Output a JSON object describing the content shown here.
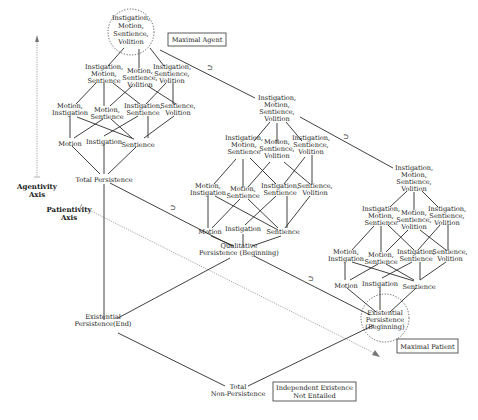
{
  "axes": {
    "agentivity": {
      "label_line1": "Agentivity",
      "label_line2": "Axis"
    },
    "patientivity": {
      "label_line1": "Patientivity",
      "label_line2": "Axis"
    }
  },
  "boxes": {
    "maximal_agent": "Maximal Agent",
    "maximal_patient": "Maximal Patient",
    "independent_existence_line1": "Independent Existence",
    "independent_existence_line2": "Not Entailed"
  },
  "relation_symbol": "⊃",
  "lattices": [
    {
      "name": "agentive-lattice-total-persistence",
      "top": [
        "Instigation,",
        "Motion,",
        "Sentience,",
        "Volition"
      ],
      "row2": [
        [
          "Instigation,",
          "Motion,",
          "Sentience"
        ],
        [
          "Motion,",
          "Sentience,",
          "Volition"
        ],
        [
          "Instigation,",
          "Sentience,",
          "Volition"
        ]
      ],
      "row3": [
        [
          "Motion,",
          "Instigation"
        ],
        [
          "Motion,",
          "Sentience"
        ],
        [
          "Instigation,",
          "Sentience"
        ],
        [
          "Sentience,",
          "Volition"
        ]
      ],
      "row4": [
        "Motion",
        "Instigation",
        "Sentience"
      ],
      "bottom": [
        "Total Persistence"
      ]
    },
    {
      "name": "agentive-lattice-qualitative-persistence",
      "top": [
        "Instigation,",
        "Motion,",
        "Sentience,",
        "Volition"
      ],
      "row2": [
        [
          "Instigation,",
          "Motion,",
          "Sentience"
        ],
        [
          "Motion,",
          "Sentience,",
          "Volition"
        ],
        [
          "Instigation,",
          "Sentience,",
          "Volition"
        ]
      ],
      "row3": [
        [
          "Motion,",
          "Instigation"
        ],
        [
          "Motion,",
          "Sentience"
        ],
        [
          "Instigation,",
          "Sentience"
        ],
        [
          "Sentience,",
          "Volition"
        ]
      ],
      "row4": [
        "Motion",
        "Instigation",
        "Sentience"
      ],
      "bottom": [
        "Qualitative",
        "Persistence (Beginning)"
      ]
    },
    {
      "name": "agentive-lattice-existential-persistence",
      "top": [
        "Instigation,",
        "Motion,",
        "Sentience,",
        "Volition"
      ],
      "row2": [
        [
          "Instigation,",
          "Motion,",
          "Sentience"
        ],
        [
          "Motion,",
          "Sentience,",
          "Volition"
        ],
        [
          "Instigation,",
          "Sentience,",
          "Volition"
        ]
      ],
      "row3": [
        [
          "Motion,",
          "Instigation"
        ],
        [
          "Motion,",
          "Sentience"
        ],
        [
          "Instigation,",
          "Sentience"
        ],
        [
          "Sentience,",
          "Volition"
        ]
      ],
      "row4": [
        "Motion",
        "Instigation",
        "Sentience"
      ],
      "bottom": [
        "Existential",
        "Persistence",
        "(Beginning)"
      ]
    }
  ],
  "persistence_nodes": {
    "existential_end": [
      "Existential",
      "Persistence(End)"
    ],
    "total_non_persistence": [
      "Total",
      "Non-Persistence"
    ]
  }
}
